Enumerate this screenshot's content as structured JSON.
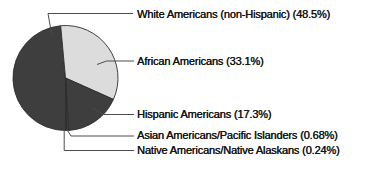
{
  "chart_data": {
    "type": "pie",
    "unit": "%",
    "start_angle_deg": 179.8,
    "legend_position": "right-callouts",
    "outline_color": "#2e2e2e",
    "leader_line_color": "#4d4d4d",
    "text_color": "#121212",
    "slices": [
      {
        "label": "White Americans (non-Hispanic)",
        "value": 48.5,
        "display": "White Americans (non-Hispanic) (48.5%)",
        "color": "#3e3e3e"
      },
      {
        "label": "African Americans",
        "value": 33.1,
        "display": "African Americans (33.1%)",
        "color": "#dcdcdc"
      },
      {
        "label": "Hispanic Americans",
        "value": 17.3,
        "display": "Hispanic Americans (17.3%)",
        "color": "#3e3e3e"
      },
      {
        "label": "Asian Americans/Pacific Islanders",
        "value": 0.68,
        "display": "Asian Americans/Pacific Islanders (0.68%)",
        "color": "#3e3e3e"
      },
      {
        "label": "Native Americans/Native Alaskans",
        "value": 0.24,
        "display": "Native Americans/Native Alaskans (0.24%)",
        "color": "#3e3e3e"
      }
    ]
  }
}
